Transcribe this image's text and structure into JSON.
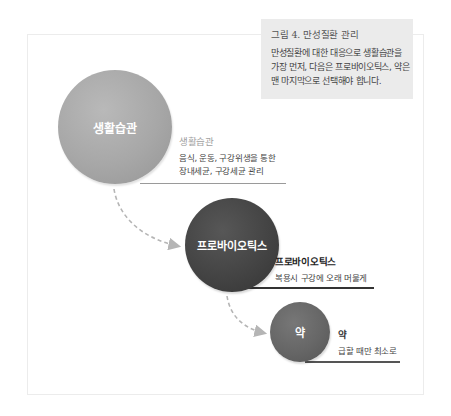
{
  "caption": {
    "title": "그림 4. 만성질환 관리",
    "body_lines": [
      "만성질환에 대한 대응으로 생활습관을",
      "가장 먼저, 다음은 프로바이오틱스, 약은",
      "맨 마지막으로 선택해야 합니다."
    ]
  },
  "steps": [
    {
      "circle_label": "생활습관",
      "title": "생활습관",
      "desc_lines": [
        "음식, 운동, 구강위생을 통한",
        "장내세균, 구강세균 관리"
      ],
      "color": "#a8a8a8"
    },
    {
      "circle_label": "프로바이오틱스",
      "title": "프로바이오틱스",
      "desc_lines": [
        "복용시 구강에 오래 머물게"
      ],
      "color": "#464646"
    },
    {
      "circle_label": "약",
      "title": "약",
      "desc_lines": [
        "급할 때만 최소로"
      ],
      "color": "#686868"
    }
  ],
  "colors": {
    "caption_bg": "#ebebeb",
    "arrow": "#b5b5b5",
    "frame_border": "#ececec"
  }
}
